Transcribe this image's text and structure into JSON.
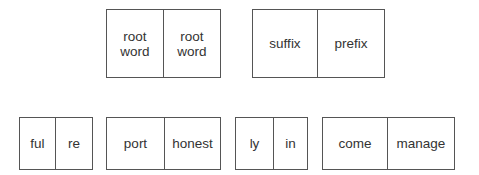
{
  "top_row": [
    {
      "cells": [
        "root\nword",
        "root\nword"
      ]
    },
    {
      "cells": [
        "suffix",
        "prefix"
      ]
    }
  ],
  "bottom_row": [
    {
      "cells": [
        "ful",
        "re"
      ]
    },
    {
      "cells": [
        "port",
        "honest"
      ]
    },
    {
      "cells": [
        "ly",
        "in"
      ]
    },
    {
      "cells": [
        "come",
        "manage"
      ]
    }
  ],
  "colors": {
    "text": "#333333",
    "border": "#555555",
    "background": "#ffffff"
  }
}
